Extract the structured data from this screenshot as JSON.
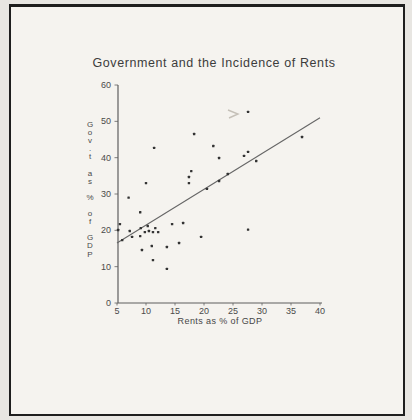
{
  "page": {
    "title": "Government and the Incidence of Rents"
  },
  "chart_data": {
    "type": "scatter",
    "title": "Government and the Incidence of Rents",
    "xlabel": "Rents as % of GDP",
    "ylabel": "Gov.t as % of GDP",
    "ylabel_vertical_chars": [
      "G",
      "o",
      "v",
      ".",
      "t",
      "",
      "a",
      "s",
      "",
      "%",
      "",
      "o",
      "f",
      "",
      "G",
      "D",
      "P"
    ],
    "xlim": [
      5,
      40
    ],
    "ylim": [
      0,
      60
    ],
    "x_ticks": [
      5,
      10,
      15,
      20,
      25,
      30,
      35,
      40
    ],
    "y_ticks": [
      60,
      50,
      40,
      30,
      20,
      10,
      0
    ],
    "grid": false,
    "legend": "none",
    "points": [
      [
        7,
        29
      ],
      [
        9,
        25
      ],
      [
        10,
        33
      ],
      [
        11.4,
        42.7
      ],
      [
        18.3,
        46.5
      ],
      [
        21.6,
        43.2
      ],
      [
        22.6,
        39.9
      ],
      [
        27.6,
        52.6
      ],
      [
        36.9,
        45.7
      ],
      [
        27.6,
        41.6
      ],
      [
        26.9,
        40.5
      ],
      [
        29,
        39.1
      ],
      [
        17.8,
        36.3
      ],
      [
        17.4,
        34.7
      ],
      [
        17.4,
        33
      ],
      [
        20.5,
        31.4
      ],
      [
        22.6,
        33.6
      ],
      [
        24.1,
        35.5
      ],
      [
        5.5,
        21.7
      ],
      [
        5.2,
        20.1
      ],
      [
        5.9,
        17.3
      ],
      [
        7.2,
        19.8
      ],
      [
        7.6,
        18.2
      ],
      [
        9.1,
        20.6
      ],
      [
        9.8,
        19.5
      ],
      [
        9,
        18.4
      ],
      [
        10.3,
        21.2
      ],
      [
        10.5,
        19.8
      ],
      [
        11.2,
        19.5
      ],
      [
        11.6,
        20.6
      ],
      [
        12.1,
        19.5
      ],
      [
        14.5,
        21.7
      ],
      [
        16.4,
        22
      ],
      [
        9.3,
        14.6
      ],
      [
        11,
        15.7
      ],
      [
        13.6,
        15.4
      ],
      [
        15.7,
        16.5
      ],
      [
        19.5,
        18.2
      ],
      [
        11.2,
        11.8
      ],
      [
        13.6,
        9.4
      ],
      [
        27.6,
        20.2
      ]
    ],
    "trend_line": {
      "x1": 5,
      "y1": 16.5,
      "x2": 40,
      "y2": 51
    },
    "colors": {
      "ink": "#3c3c3c",
      "axis": "#5f5f5f",
      "tick_text": "#4a4a4a",
      "dot": "#333333",
      "line": "#666666",
      "paper": "#f5f3ef",
      "outside": "#e8e6e2",
      "frame": "#1e1e1e"
    }
  }
}
